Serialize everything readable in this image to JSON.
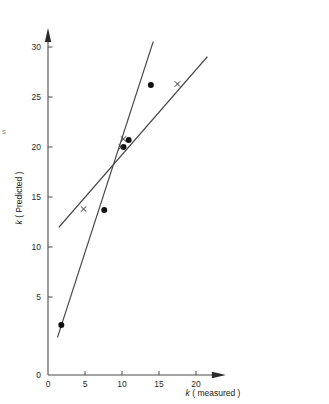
{
  "figure": {
    "background_color": "#ffffff",
    "axis_color": "#4a4a4a",
    "marker_dot_color": "#111111",
    "marker_cross_color": "#333333",
    "edge_artifact": "s"
  },
  "chart_data": {
    "type": "scatter",
    "title": "",
    "xlabel_italic": "k",
    "xlabel_rest": " ( measured )",
    "ylabel_italic": "k",
    "ylabel_rest": " ( Predicted )",
    "xlim": [
      0,
      23.5
    ],
    "ylim": [
      0,
      31.5
    ],
    "xticks": [
      0,
      5,
      10,
      15,
      20
    ],
    "xtick_labels": [
      "0",
      "5",
      "10",
      "15",
      "20"
    ],
    "yticks": [
      0,
      5,
      10,
      15,
      20,
      25,
      30
    ],
    "ytick_labels": [
      "0",
      "5",
      "10",
      "15",
      "20",
      "25",
      "30"
    ],
    "grid": false,
    "legend": "none",
    "series": [
      {
        "name": "filled-circle-series",
        "marker": "circle",
        "points": [
          {
            "x": 1.8,
            "y": 2.2
          },
          {
            "x": 7.6,
            "y": 13.7
          },
          {
            "x": 10.2,
            "y": 20.0
          },
          {
            "x": 10.9,
            "y": 20.7
          },
          {
            "x": 13.9,
            "y": 26.2
          }
        ]
      },
      {
        "name": "cross-series",
        "marker": "cross",
        "points": [
          {
            "x": 4.8,
            "y": 13.8
          },
          {
            "x": 9.9,
            "y": 20.0
          },
          {
            "x": 10.2,
            "y": 20.8
          },
          {
            "x": 17.5,
            "y": 26.3
          }
        ]
      }
    ],
    "fit_lines": [
      {
        "name": "steep-fit-line",
        "x0": 1.3,
        "y0": 1.0,
        "x1": 14.2,
        "y1": 30.5
      },
      {
        "name": "shallow-fit-line",
        "x0": 1.5,
        "y0": 12.0,
        "x1": 21.5,
        "y1": 29.0
      }
    ]
  }
}
